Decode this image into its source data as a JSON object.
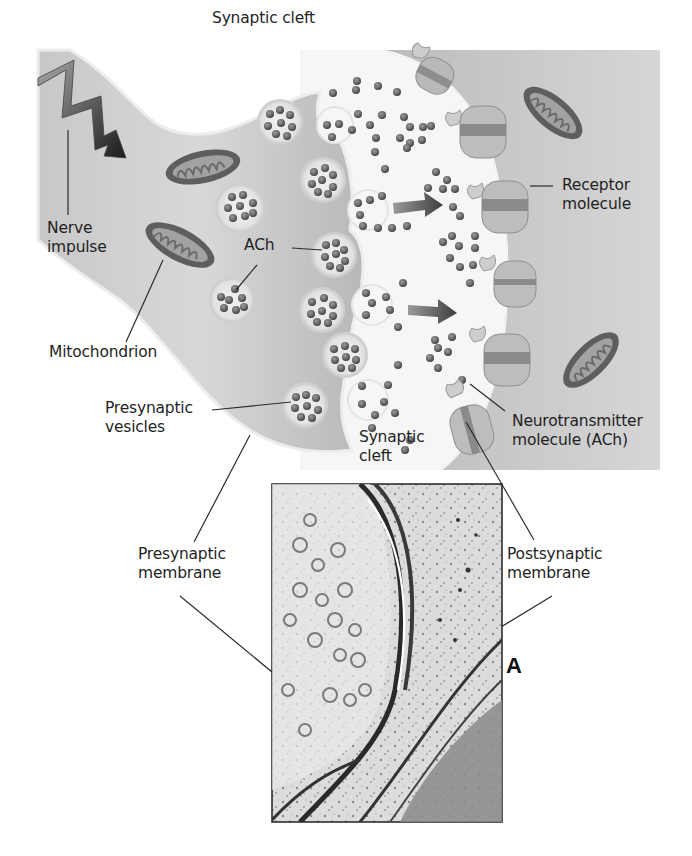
{
  "figure": {
    "panel_letter": "A",
    "colors": {
      "presynaptic_terminal": "#bdbdbd",
      "postsynaptic_cell": "#c6c6c6",
      "cleft": "#f4f4f4",
      "neurotransmitter": "#6a6a6a",
      "receptor": "#a9a9a9",
      "mitochondrion_outer": "#5a5a5a",
      "mitochondrion_inner": "#9a9a9a",
      "micrograph_bg": "#d9d9d9"
    }
  },
  "labels": {
    "synaptic_cleft_top": "Synaptic cleft",
    "nerve_impulse_line1": "Nerve",
    "nerve_impulse_line2": "impulse",
    "ach": "ACh",
    "mitochondrion": "Mitochondrion",
    "presynaptic_vesicles_line1": "Presynaptic",
    "presynaptic_vesicles_line2": "vesicles",
    "synaptic_cleft_bottom_line1": "Synaptic",
    "synaptic_cleft_bottom_line2": "cleft",
    "receptor_molecule_line1": "Receptor",
    "receptor_molecule_line2": "molecule",
    "neurotransmitter_line1": "Neurotransmitter",
    "neurotransmitter_line2": "molecule (ACh)",
    "presynaptic_membrane_line1": "Presynaptic",
    "presynaptic_membrane_line2": "membrane",
    "postsynaptic_membrane_line1": "Postsynaptic",
    "postsynaptic_membrane_line2": "membrane"
  }
}
